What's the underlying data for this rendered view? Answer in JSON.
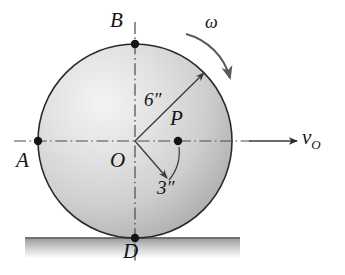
{
  "figure": {
    "background_color": "#ffffff",
    "ink_color": "#141414"
  },
  "labels": {
    "point_b": "B",
    "point_a": "A",
    "point_o": "O",
    "point_p": "P",
    "point_d": "D",
    "radius_outer": "6″",
    "radius_inner": "3″",
    "angular_velocity": "ω",
    "velocity_symbol": "v",
    "velocity_subscript": "O"
  },
  "geometry": {
    "circle": {
      "center_x": 135,
      "center_y": 141,
      "radius": 97,
      "outline_color": "#2a2a2a",
      "outline_width": 1.6,
      "fill_light": "#f2f2f2",
      "fill_mid": "#d8d8d8",
      "fill_dark": "#a8a8a8"
    },
    "points": [
      {
        "name": "B",
        "x": 135,
        "y": 44,
        "label_x": 112,
        "label_y": 12
      },
      {
        "name": "A",
        "x": 38,
        "y": 141,
        "label_x": 18,
        "label_y": 152
      },
      {
        "name": "O",
        "x": 135,
        "y": 141,
        "label_x": 112,
        "label_y": 152
      },
      {
        "name": "P",
        "x": 178,
        "y": 141,
        "label_x": 172,
        "label_y": 110
      },
      {
        "name": "D",
        "x": 135,
        "y": 238,
        "label_x": 124,
        "label_y": 243
      }
    ],
    "ground": {
      "left": 25,
      "right": 240,
      "top_y": 238,
      "thickness": 20,
      "line_color": "#4a4a4a",
      "hatch_top_color": "#9a9a9a",
      "hatch_bottom_color": "#ffffff"
    },
    "dim_arrow_6in": {
      "from_x": 135,
      "from_y": 141,
      "to_x": 204,
      "to_y": 73
    },
    "dim_arrow_3in": {
      "from_x": 135,
      "from_y": 141,
      "to_x": 166,
      "to_y": 178
    },
    "dim_arc_3in": {
      "from_x": 178,
      "from_y": 145,
      "to_x": 168,
      "to_y": 180,
      "radius": 43
    },
    "omega_arc": {
      "from_x": 189,
      "from_y": 36,
      "to_x": 232,
      "to_y": 80
    },
    "velocity_arrow": {
      "from_x": 249,
      "from_y": 141,
      "to_x": 298,
      "to_y": 141
    },
    "centerline_horizontal": {
      "x1": 14,
      "y1": 141,
      "x2": 250,
      "y2": 141
    },
    "centerline_vertical": {
      "x1": 135,
      "y1": 22,
      "x2": 135,
      "y2": 262
    }
  },
  "label_positions": {
    "six_inch": {
      "x": 146,
      "y": 96
    },
    "three_inch": {
      "x": 158,
      "y": 182
    },
    "omega": {
      "x": 206,
      "y": 20
    },
    "velocity": {
      "x": 303,
      "y": 130
    }
  }
}
